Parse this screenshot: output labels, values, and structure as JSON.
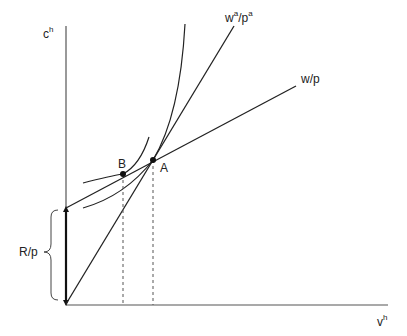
{
  "diagram": {
    "axes": {
      "y_label": "c",
      "y_label_sup": "h",
      "x_label": "v",
      "x_label_sup": "h"
    },
    "lines": {
      "budget_w_p": {
        "label": "w/p"
      },
      "budget_wa_pa": {
        "label_main": "w",
        "label_sup1": "a",
        "label_mid": "/p",
        "label_sup2": "a"
      }
    },
    "points": {
      "A": "A",
      "B": "B"
    },
    "bracket": {
      "label": "R/p"
    },
    "colors": {
      "stroke": "#222222",
      "dashed": "#555555"
    }
  }
}
